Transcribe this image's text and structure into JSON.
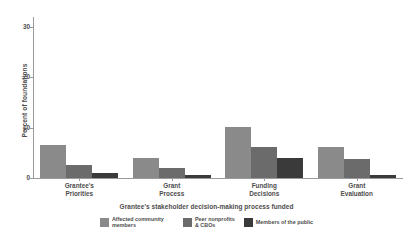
{
  "chart_data": {
    "type": "bar",
    "title": "",
    "xlabel": "Grantee's stakeholder decision-making process funded",
    "ylabel": "Percent of foundations",
    "categories": [
      "Grantee's Priorities",
      "Grant Process",
      "Funding Decisions",
      "Grant Evaluation"
    ],
    "category_lines": [
      [
        "Grantee's",
        "Priorities"
      ],
      [
        "Grant",
        "Process"
      ],
      [
        "Funding",
        "Decisions"
      ],
      [
        "Grant",
        "Evaluation"
      ]
    ],
    "series": [
      {
        "name": "Affected community members",
        "color": "#8a8a8a",
        "values": [
          6.5,
          4.0,
          10.1,
          6.1
        ]
      },
      {
        "name": "Peer nonprofits & CBOs",
        "color": "#6b6b6b",
        "values": [
          2.5,
          1.9,
          6.1,
          3.8
        ]
      },
      {
        "name": "Members of the public",
        "color": "#3a3a3a",
        "values": [
          1.0,
          0.5,
          4.0,
          0.5
        ]
      }
    ],
    "ylim": [
      0,
      32
    ],
    "yticks": [
      0,
      10,
      20,
      30
    ],
    "ytick_labels": [
      "0",
      "10",
      "20",
      "30"
    ],
    "grid": false,
    "legend_position": "bottom",
    "legend_entries": [
      {
        "label": "Affected community members",
        "lines": [
          "Affected community members"
        ],
        "color": "#8a8a8a"
      },
      {
        "label": "Peer nonprofits & CBOs",
        "lines": [
          "Peer nonprofits",
          "& CBOs"
        ],
        "color": "#6b6b6b"
      },
      {
        "label": "Members of the public",
        "lines": [
          "Members of the public"
        ],
        "color": "#3a3a3a"
      }
    ]
  },
  "axis": {
    "y_title": "Percent of foundations",
    "x_title": "Grantee's stakeholder decision-making process funded"
  }
}
